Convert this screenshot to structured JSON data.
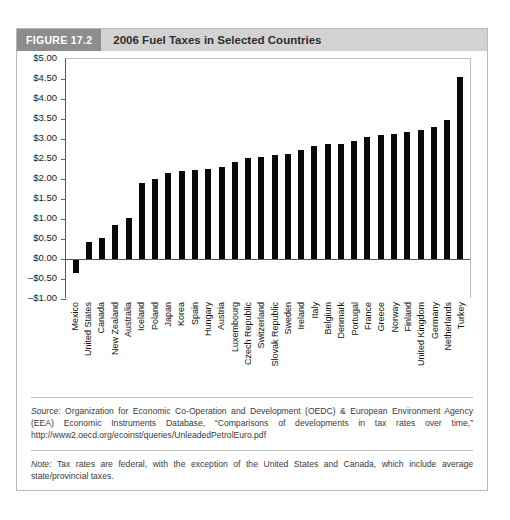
{
  "figure": {
    "tag": "FIGURE 17.2",
    "title": "2006 Fuel Taxes in Selected Countries"
  },
  "captions": {
    "source_label": "Source:",
    "source_text": " Organization for Economic Co-Operation and Development (OEDC) & European Environment Agency (EEA) Economic Instruments Database, “Comparisons of developments in tax rates over time,” http://www2.oecd.org/ecoinst/queries/UnleadedPetrolEuro.pdf",
    "note_label": "Note:",
    "note_text": " Tax rates are federal, with the exception of the United States and Canada, which include average state/provincial taxes."
  },
  "colors": {
    "bar": "#0a0a0a",
    "header_band": "#d2d2d2",
    "header_tag": "#8d8d8d",
    "frame": "#b9b9b9"
  },
  "chart_data": {
    "type": "bar",
    "title": "2006 Fuel Taxes in Selected Countries",
    "xlabel": "",
    "ylabel": "",
    "ylim": [
      -1.0,
      5.0
    ],
    "ytick_step": 0.5,
    "grid": false,
    "legend": "none",
    "ytick_labels": [
      "$5.00",
      "$4.50",
      "$4.00",
      "$3.50",
      "$3.00",
      "$2.50",
      "$2.00",
      "$1.50",
      "$1.00",
      "$0.50",
      "$0.00",
      "–$0.50",
      "–$1.00"
    ],
    "ytick_values": [
      5.0,
      4.5,
      4.0,
      3.5,
      3.0,
      2.5,
      2.0,
      1.5,
      1.0,
      0.5,
      0.0,
      -0.5,
      -1.0
    ],
    "categories": [
      "Mexico",
      "United States",
      "Canada",
      "New Zealand",
      "Australia",
      "Iceland",
      "Poland",
      "Japan",
      "Korea",
      "Spain",
      "Hungary",
      "Austria",
      "Luxembourg",
      "Czech Republic",
      "Switzerland",
      "Slovak Republic",
      "Sweden",
      "Ireland",
      "Italy",
      "Belgium",
      "Denmark",
      "Portugal",
      "France",
      "Greece",
      "Norway",
      "Finland",
      "United Kingdom",
      "Germany",
      "Netherlands",
      "Turkey"
    ],
    "values": [
      -0.35,
      0.42,
      0.52,
      0.85,
      1.02,
      1.9,
      2.0,
      2.15,
      2.2,
      2.22,
      2.25,
      2.3,
      2.42,
      2.52,
      2.56,
      2.6,
      2.62,
      2.72,
      2.82,
      2.88,
      2.88,
      2.96,
      3.06,
      3.1,
      3.12,
      3.18,
      3.22,
      3.3,
      3.48,
      4.55
    ]
  }
}
